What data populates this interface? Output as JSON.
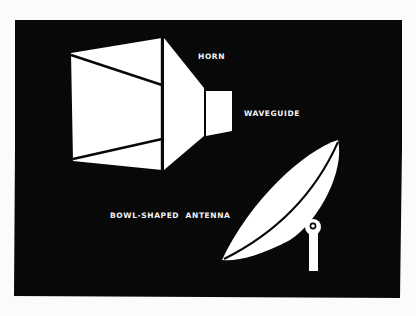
{
  "figure": {
    "background_color": "#080808",
    "page_color": "#fbfbf9",
    "foreground_color": "#ffffff",
    "labels": {
      "horn": "HORN",
      "waveguide": "WAVEGUIDE",
      "antenna": "BOWL-SHAPED  ANTENNA"
    }
  }
}
